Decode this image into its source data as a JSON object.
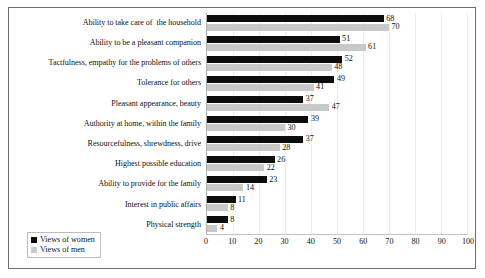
{
  "chart_data": {
    "type": "bar",
    "orientation": "horizontal",
    "title": "",
    "subtitle": "",
    "xlabel": "",
    "ylabel": "",
    "xlim": [
      0,
      100
    ],
    "xticks": [
      0,
      10,
      20,
      30,
      40,
      50,
      60,
      70,
      80,
      90,
      100
    ],
    "grid": true,
    "legend_position": "bottom-left",
    "categories": [
      "Ability to take care of  the household",
      "Ability to be a pleasant companion",
      "Tactfulness, empathy for the problems of others",
      "Tolerance for others",
      "Pleasant appearance, beauty",
      "Authority at home, within the family",
      "Resourcefulness, shrewdness, drive",
      "Highest possible education",
      "Ability to provide for the family",
      "Interest in public affairs",
      "Physical strength"
    ],
    "series": [
      {
        "name": "Views of women",
        "color": "#0d0d0d",
        "values": [
          68,
          51,
          52,
          49,
          37,
          39,
          37,
          26,
          23,
          11,
          8
        ]
      },
      {
        "name": "Views of men",
        "color": "#c9c9c9",
        "values": [
          70,
          61,
          48,
          41,
          47,
          30,
          28,
          22,
          14,
          8,
          4
        ]
      }
    ]
  },
  "legend": {
    "items": [
      {
        "label": "Views of women",
        "color": "#0d0d0d"
      },
      {
        "label": "Views of men",
        "color": "#c9c9c9"
      }
    ]
  }
}
